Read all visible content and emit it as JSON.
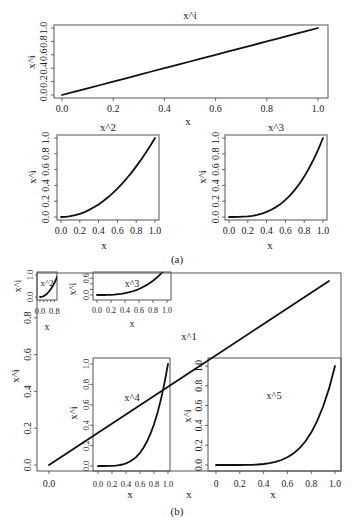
{
  "figure": {
    "caption_a": "(a)",
    "caption_b": "(b)"
  },
  "chart_data": [
    {
      "id": "a-x-power-i",
      "group": "(a)",
      "type": "line",
      "title": "x^i",
      "xlabel": "x",
      "ylabel": "x^i",
      "xlim": [
        0,
        1
      ],
      "ylim": [
        0,
        1
      ],
      "xticks": [
        {
          "v": 0,
          "label": "0.0"
        },
        {
          "v": 0.2,
          "label": "0.2"
        },
        {
          "v": 0.4,
          "label": "0.4"
        },
        {
          "v": 0.6,
          "label": "0.6"
        },
        {
          "v": 0.8,
          "label": "0.8"
        },
        {
          "v": 1,
          "label": "1.0"
        }
      ],
      "yticks": [
        {
          "v": 0,
          "label": "0.0"
        },
        {
          "v": 0.2,
          "label": "0.2"
        },
        {
          "v": 0.4,
          "label": "0.4"
        },
        {
          "v": 0.6,
          "label": "0.6"
        },
        {
          "v": 0.8,
          "label": "0.8"
        },
        {
          "v": 1,
          "label": "1.0"
        }
      ],
      "x": [
        0,
        0.05,
        0.1,
        0.15,
        0.2,
        0.25,
        0.3,
        0.35,
        0.4,
        0.45,
        0.5,
        0.55,
        0.6,
        0.65,
        0.7,
        0.75,
        0.8,
        0.85,
        0.9,
        0.95,
        1
      ],
      "y": [
        0,
        0.05,
        0.1,
        0.15,
        0.2,
        0.25,
        0.3,
        0.35,
        0.4,
        0.45,
        0.5,
        0.55,
        0.6,
        0.65,
        0.7,
        0.75,
        0.8,
        0.85,
        0.9,
        0.95,
        1
      ]
    },
    {
      "id": "a-x-squared",
      "group": "(a)",
      "type": "line",
      "title": "x^2",
      "xlabel": "x",
      "ylabel": "x^i",
      "xlim": [
        0,
        1
      ],
      "ylim": [
        0,
        1
      ],
      "xticks": [
        {
          "v": 0,
          "label": "0.0"
        },
        {
          "v": 0.2,
          "label": "0.2"
        },
        {
          "v": 0.4,
          "label": "0.4"
        },
        {
          "v": 0.6,
          "label": "0.6"
        },
        {
          "v": 0.8,
          "label": "0.8"
        },
        {
          "v": 1,
          "label": "1.0"
        }
      ],
      "yticks": [
        {
          "v": 0,
          "label": "0.0"
        },
        {
          "v": 0.2,
          "label": "0.2"
        },
        {
          "v": 0.4,
          "label": "0.4"
        },
        {
          "v": 0.6,
          "label": "0.6"
        },
        {
          "v": 0.8,
          "label": "0.8"
        },
        {
          "v": 1,
          "label": "1.0"
        }
      ],
      "x": [
        0,
        0.05,
        0.1,
        0.15,
        0.2,
        0.25,
        0.3,
        0.35,
        0.4,
        0.45,
        0.5,
        0.55,
        0.6,
        0.65,
        0.7,
        0.75,
        0.8,
        0.85,
        0.9,
        0.95,
        1
      ],
      "y": [
        0,
        0.0025,
        0.01,
        0.0225,
        0.04,
        0.0625,
        0.09,
        0.1225,
        0.16,
        0.2025,
        0.25,
        0.3025,
        0.36,
        0.4225,
        0.49,
        0.5625,
        0.64,
        0.7225,
        0.81,
        0.9025,
        1
      ]
    },
    {
      "id": "a-x-cubed",
      "group": "(a)",
      "type": "line",
      "title": "x^3",
      "xlabel": "x",
      "ylabel": "x^i",
      "xlim": [
        0,
        1
      ],
      "ylim": [
        0,
        1
      ],
      "xticks": [
        {
          "v": 0,
          "label": "0.0"
        },
        {
          "v": 0.2,
          "label": "0.2"
        },
        {
          "v": 0.4,
          "label": "0.4"
        },
        {
          "v": 0.6,
          "label": "0.6"
        },
        {
          "v": 0.8,
          "label": "0.8"
        },
        {
          "v": 1,
          "label": "1.0"
        }
      ],
      "yticks": [
        {
          "v": 0,
          "label": "0.0"
        },
        {
          "v": 0.2,
          "label": "0.2"
        },
        {
          "v": 0.4,
          "label": "0.4"
        },
        {
          "v": 0.6,
          "label": "0.6"
        },
        {
          "v": 0.8,
          "label": "0.8"
        },
        {
          "v": 1,
          "label": "1.0"
        }
      ],
      "x": [
        0,
        0.05,
        0.1,
        0.15,
        0.2,
        0.25,
        0.3,
        0.35,
        0.4,
        0.45,
        0.5,
        0.55,
        0.6,
        0.65,
        0.7,
        0.75,
        0.8,
        0.85,
        0.9,
        0.95,
        1
      ],
      "y": [
        0,
        0.0001,
        0.001,
        0.0034,
        0.008,
        0.0156,
        0.027,
        0.0429,
        0.064,
        0.0911,
        0.125,
        0.1664,
        0.216,
        0.2746,
        0.343,
        0.4219,
        0.512,
        0.6141,
        0.729,
        0.8574,
        1
      ]
    },
    {
      "id": "b-inset-x-squared",
      "group": "(b)",
      "type": "line",
      "title": "x^2",
      "xlabel": "x",
      "ylabel": "x^i",
      "xlim": [
        0,
        1
      ],
      "ylim": [
        0,
        1
      ],
      "xticks": [
        {
          "v": 0,
          "label": "0.0"
        },
        {
          "v": 0.2,
          "label": ""
        },
        {
          "v": 0.4,
          "label": ""
        },
        {
          "v": 0.6,
          "label": ""
        },
        {
          "v": 0.8,
          "label": "0.8"
        }
      ],
      "yticks": [
        {
          "v": 0,
          "label": "0.0"
        },
        {
          "v": 1,
          "label": "1.0"
        }
      ],
      "x": [
        0,
        0.05,
        0.1,
        0.15,
        0.2,
        0.25,
        0.3,
        0.35,
        0.4,
        0.45,
        0.5,
        0.55,
        0.6,
        0.65,
        0.7,
        0.75,
        0.8,
        0.85,
        0.9,
        0.95,
        1
      ],
      "y": [
        0,
        0.0025,
        0.01,
        0.0225,
        0.04,
        0.0625,
        0.09,
        0.1225,
        0.16,
        0.2025,
        0.25,
        0.3025,
        0.36,
        0.4225,
        0.49,
        0.5625,
        0.64,
        0.7225,
        0.81,
        0.9025,
        1
      ]
    },
    {
      "id": "b-inset-x-cubed",
      "group": "(b)",
      "type": "line",
      "title": "x^3",
      "xlabel": "x",
      "ylabel": "x^i",
      "xlim": [
        0,
        1
      ],
      "ylim": [
        0,
        0.6
      ],
      "xticks": [
        {
          "v": 0,
          "label": "0.0"
        },
        {
          "v": 0.2,
          "label": "0.2"
        },
        {
          "v": 0.4,
          "label": "0.4"
        },
        {
          "v": 0.6,
          "label": "0.6"
        },
        {
          "v": 0.8,
          "label": "0.8"
        },
        {
          "v": 1,
          "label": "1.0"
        }
      ],
      "yticks": [
        {
          "v": 0,
          "label": "0.0"
        },
        {
          "v": 0.2,
          "label": ""
        },
        {
          "v": 0.4,
          "label": ""
        },
        {
          "v": 0.6,
          "label": "0.6"
        }
      ],
      "x": [
        0,
        0.05,
        0.1,
        0.15,
        0.2,
        0.25,
        0.3,
        0.35,
        0.4,
        0.45,
        0.5,
        0.55,
        0.6,
        0.65,
        0.7,
        0.75,
        0.8,
        0.85,
        0.9,
        0.95,
        1
      ],
      "y": [
        0,
        0.0001,
        0.001,
        0.0034,
        0.008,
        0.0156,
        0.027,
        0.0429,
        0.064,
        0.0911,
        0.125,
        0.1664,
        0.216,
        0.2746,
        0.343,
        0.4219,
        0.512,
        0.6141,
        0.729,
        0.8574,
        1
      ]
    },
    {
      "id": "b-inset-x-fourth",
      "group": "(b)",
      "type": "line",
      "title": "x^4",
      "xlabel": "x",
      "ylabel": "x^i",
      "xlim": [
        0,
        1
      ],
      "ylim": [
        0,
        1
      ],
      "xticks": [
        {
          "v": 0,
          "label": "0.0"
        },
        {
          "v": 0.2,
          "label": "0.2"
        },
        {
          "v": 0.4,
          "label": "0.4"
        },
        {
          "v": 0.6,
          "label": "0.6"
        },
        {
          "v": 0.8,
          "label": "0.8"
        },
        {
          "v": 1,
          "label": "1.0"
        }
      ],
      "yticks": [
        {
          "v": 0,
          "label": "0.0"
        },
        {
          "v": 0.2,
          "label": "0.2"
        },
        {
          "v": 0.4,
          "label": "0.4"
        },
        {
          "v": 0.6,
          "label": "0.6"
        },
        {
          "v": 0.8,
          "label": "0.8"
        },
        {
          "v": 1,
          "label": "1.0"
        }
      ],
      "x": [
        0,
        0.05,
        0.1,
        0.15,
        0.2,
        0.25,
        0.3,
        0.35,
        0.4,
        0.45,
        0.5,
        0.55,
        0.6,
        0.65,
        0.7,
        0.75,
        0.8,
        0.85,
        0.9,
        0.95,
        1
      ],
      "y": [
        0,
        0,
        0.0001,
        0.0005,
        0.0016,
        0.0039,
        0.0081,
        0.015,
        0.0256,
        0.041,
        0.0625,
        0.0915,
        0.1296,
        0.1785,
        0.2401,
        0.3164,
        0.4096,
        0.522,
        0.6561,
        0.8145,
        1
      ]
    },
    {
      "id": "b-inset-x-fifth",
      "group": "(b)",
      "type": "line",
      "title": "x^5",
      "xlabel": "x",
      "ylabel": "x^i",
      "xlim": [
        0,
        1
      ],
      "ylim": [
        0,
        1
      ],
      "xticks": [
        {
          "v": 0,
          "label": "0"
        },
        {
          "v": 0.2,
          "label": "0.2"
        },
        {
          "v": 0.4,
          "label": "0.4"
        },
        {
          "v": 0.6,
          "label": "0.6"
        },
        {
          "v": 0.8,
          "label": "0.8"
        },
        {
          "v": 1,
          "label": "1.0"
        }
      ],
      "yticks": [
        {
          "v": 0,
          "label": "0.0"
        },
        {
          "v": 0.2,
          "label": "0.2"
        },
        {
          "v": 0.4,
          "label": "0.4"
        },
        {
          "v": 0.6,
          "label": "0.6"
        },
        {
          "v": 0.8,
          "label": "0.8"
        },
        {
          "v": 1,
          "label": "1.0"
        }
      ],
      "x": [
        0,
        0.05,
        0.1,
        0.15,
        0.2,
        0.25,
        0.3,
        0.35,
        0.4,
        0.45,
        0.5,
        0.55,
        0.6,
        0.65,
        0.7,
        0.75,
        0.8,
        0.85,
        0.9,
        0.95,
        1
      ],
      "y": [
        0,
        0,
        0,
        0.0001,
        0.0003,
        0.001,
        0.0024,
        0.0053,
        0.0102,
        0.0185,
        0.0313,
        0.0503,
        0.0778,
        0.116,
        0.1681,
        0.2373,
        0.3277,
        0.4437,
        0.5905,
        0.7738,
        1
      ]
    },
    {
      "id": "b-main-x-first",
      "group": "(b)",
      "type": "line",
      "title": "x^1",
      "xlabel": "x",
      "ylabel": "x^i",
      "xlim": [
        0,
        1
      ],
      "ylim": [
        0,
        1
      ],
      "xticks": [
        {
          "v": 0,
          "label": "0.0"
        }
      ],
      "yticks": [
        {
          "v": 0,
          "label": "0.0"
        },
        {
          "v": 0.2,
          "label": "0.2"
        },
        {
          "v": 0.4,
          "label": "0.4"
        },
        {
          "v": 0.6,
          "label": "0.6"
        },
        {
          "v": 0.8,
          "label": "0.8"
        }
      ],
      "x": [
        0,
        0.25,
        0.5,
        0.75,
        1
      ],
      "y": [
        0,
        0.25,
        0.5,
        0.75,
        1
      ]
    }
  ]
}
